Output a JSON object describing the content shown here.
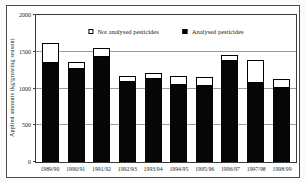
{
  "chart_data": {
    "type": "bar",
    "stacked": true,
    "title": "",
    "xlabel": "",
    "ylabel": "Applied amounts (kg/growing season)",
    "ylim": [
      0,
      2000
    ],
    "y_ticks": [
      0,
      500,
      1000,
      1500,
      2000
    ],
    "grid": true,
    "legend_position": "top-center-inside",
    "categories": [
      "1989/90",
      "1990/91",
      "1991/92",
      "1992/93",
      "1993/94",
      "1994/95",
      "1995/96",
      "1996/97",
      "1997/98",
      "1998/99"
    ],
    "series": [
      {
        "name": "Analysed pesticides",
        "color": "#000000",
        "values": [
          1350,
          1265,
          1435,
          1090,
          1125,
          1050,
          1040,
          1380,
          1075,
          1005
        ]
      },
      {
        "name": "Not analysed pesticides",
        "color": "#ffffff",
        "values": [
          270,
          95,
          110,
          85,
          80,
          120,
          115,
          80,
          315,
          130
        ]
      }
    ],
    "totals": [
      1620,
      1360,
      1545,
      1175,
      1205,
      1170,
      1155,
      1460,
      1390,
      1135
    ],
    "legend": [
      {
        "label": "Not analysed pesticides",
        "swatch": "#ffffff"
      },
      {
        "label": "Analysed pesticides",
        "swatch": "#000000"
      }
    ]
  },
  "colors": {
    "axis": "#3a3a3a",
    "grid": "#9c9c9c",
    "frame_border": "#4a4a4a",
    "background": "#ffffff",
    "bar_black": "#060606",
    "bar_white": "#ffffff"
  }
}
